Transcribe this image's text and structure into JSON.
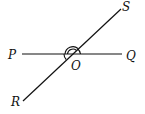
{
  "diagram": {
    "type": "intersecting-lines",
    "labels": {
      "P": "P",
      "Q": "Q",
      "R": "R",
      "S": "S",
      "O": "O"
    },
    "lines": [
      {
        "name": "PQ",
        "from": "P",
        "to": "Q"
      },
      {
        "name": "RS",
        "from": "R",
        "to": "S"
      }
    ],
    "intersection": "O",
    "angle_marks": [
      {
        "angle": "POS",
        "arcs": 2
      },
      {
        "angle": "SOQ",
        "arcs": 1
      },
      {
        "angle": "POR",
        "arcs": 1
      }
    ],
    "stroke_color": "#111111"
  }
}
